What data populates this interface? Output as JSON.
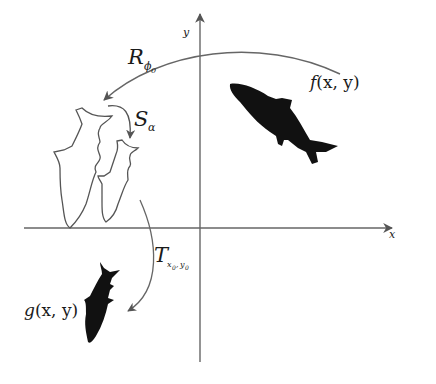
{
  "diagram": {
    "axes": {
      "x_label": "x",
      "y_label": "y"
    },
    "functions": {
      "original": {
        "name": "f",
        "args": "(x, y)"
      },
      "result": {
        "name": "g",
        "args": "(x, y)"
      }
    },
    "operations": [
      {
        "id": "rotation",
        "symbol": "R",
        "subscript": "ϕ",
        "subscript2": "0"
      },
      {
        "id": "scaling",
        "symbol": "S",
        "subscript": "α"
      },
      {
        "id": "translation",
        "symbol": "T",
        "subscript": "x",
        "subscript_x_index": "0",
        "subscript_sep": ",",
        "subscript_y": "y",
        "subscript_y_index": "0"
      }
    ],
    "shapes": [
      {
        "id": "shark-original",
        "style": "filled",
        "color": "#111111"
      },
      {
        "id": "shark-rotated",
        "style": "outline",
        "color": "#555555"
      },
      {
        "id": "shark-scaled",
        "style": "outline",
        "color": "#555555"
      },
      {
        "id": "shark-translated",
        "style": "filled",
        "color": "#111111"
      }
    ],
    "colors": {
      "axis": "#666666",
      "arrow": "#666666",
      "ink": "#111111"
    }
  }
}
